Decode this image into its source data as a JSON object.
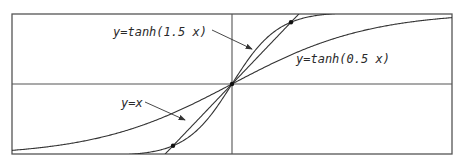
{
  "chart_data": {
    "type": "line",
    "title": "",
    "xlabel": "",
    "ylabel": "",
    "xlim": [
      -3.2,
      3.2
    ],
    "ylim": [
      -1.0,
      1.0
    ],
    "grid": false,
    "axes_through_origin": true,
    "frame": true,
    "series": [
      {
        "name": "y=tanh(1.5 x)",
        "function": "tanh(1.5*x)",
        "color": "#333333"
      },
      {
        "name": "y=tanh(0.5 x)",
        "function": "tanh(0.5*x)",
        "color": "#333333"
      },
      {
        "name": "y=x",
        "function": "x",
        "color": "#333333"
      }
    ],
    "marked_points": [
      {
        "x": 0,
        "y": 0
      },
      {
        "x": 0.858,
        "y": 0.858
      },
      {
        "x": -0.858,
        "y": -0.858
      }
    ],
    "annotations": [
      {
        "text": "y=tanh(1.5 x)",
        "arrow_to_series": "y=tanh(1.5 x)"
      },
      {
        "text": "y=tanh(0.5 x)",
        "arrow_to_series": null
      },
      {
        "text": "y=x",
        "arrow_to_series": "y=x"
      }
    ]
  },
  "labels": {
    "tanh15": "y=tanh(1.5 x)",
    "tanh05": "y=tanh(0.5 x)",
    "identity": "y=x"
  },
  "style": {
    "line_color": "#333333",
    "frame_color": "#555555",
    "background": "#ffffff"
  }
}
